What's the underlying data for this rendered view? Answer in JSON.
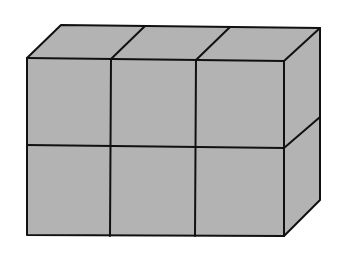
{
  "diagram": {
    "type": "isometric-cube-arrangement",
    "columns": 3,
    "rows": 2,
    "depth": 1,
    "total_cubes": 6,
    "colors": {
      "face": "#b3b3b3",
      "edge": "#111111",
      "background": "#ffffff"
    }
  }
}
